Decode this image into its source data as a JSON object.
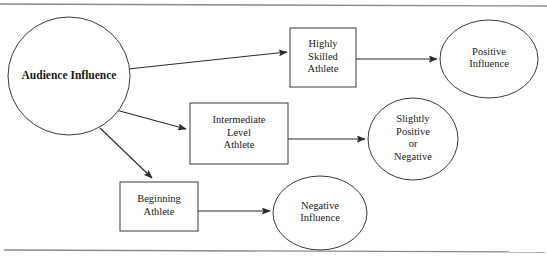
{
  "figure": {
    "type": "flow-diagram",
    "top_rule": true,
    "bottom_rule": true,
    "colors": {
      "background": "#ffffff",
      "shape_stroke": "#3a3a3a",
      "connector_stroke": "#2b2b2b",
      "rule_stroke": "#8a8a8a",
      "text": "#1a1a1a"
    }
  },
  "nodes": [
    {
      "id": "audience-influence",
      "shape": "circle",
      "bold": true,
      "lines": [
        "Audience Influence"
      ],
      "cx": 69,
      "cy": 76,
      "rx": 61,
      "ry": 59
    },
    {
      "id": "highly-skilled-athlete",
      "shape": "rect",
      "bold": false,
      "lines": [
        "Highly",
        "Skilled",
        "Athlete"
      ],
      "x": 290,
      "y": 28,
      "w": 66,
      "h": 59
    },
    {
      "id": "intermediate-level-athlete",
      "shape": "rect",
      "bold": false,
      "lines": [
        "Intermediate",
        "Level",
        "Athlete"
      ],
      "x": 190,
      "y": 103,
      "w": 98,
      "h": 61
    },
    {
      "id": "beginning-athlete",
      "shape": "rect",
      "bold": false,
      "lines": [
        "Beginning",
        "Athlete"
      ],
      "x": 120,
      "y": 182,
      "w": 78,
      "h": 49
    },
    {
      "id": "positive-influence",
      "shape": "ellipse",
      "bold": false,
      "lines": [
        "Positive",
        "Influence"
      ],
      "cx": 489,
      "cy": 59,
      "rx": 49,
      "ry": 39
    },
    {
      "id": "slightly-positive-or-negative",
      "shape": "ellipse",
      "bold": false,
      "lines": [
        "Slightly",
        "Positive",
        "or",
        "Negative"
      ],
      "cx": 413,
      "cy": 139,
      "rx": 45,
      "ry": 41
    },
    {
      "id": "negative-influence",
      "shape": "ellipse",
      "bold": false,
      "lines": [
        "Negative",
        "Influence"
      ],
      "cx": 320,
      "cy": 213,
      "rx": 47,
      "ry": 37
    }
  ],
  "connectors": [
    {
      "id": "audience-to-highly-skilled",
      "from": "audience-influence",
      "to": "highly-skilled-athlete",
      "x1": 128,
      "y1": 69,
      "x2": 287,
      "y2": 52
    },
    {
      "id": "audience-to-intermediate",
      "from": "audience-influence",
      "to": "intermediate-level-athlete",
      "x1": 116,
      "y1": 110,
      "x2": 186,
      "y2": 129
    },
    {
      "id": "audience-to-beginning",
      "from": "audience-influence",
      "to": "beginning-athlete",
      "x1": 100,
      "y1": 128,
      "x2": 152,
      "y2": 178
    },
    {
      "id": "highly-skilled-to-positive",
      "from": "highly-skilled-athlete",
      "to": "positive-influence",
      "x1": 356,
      "y1": 59,
      "x2": 437,
      "y2": 59
    },
    {
      "id": "intermediate-to-slightly",
      "from": "intermediate-level-athlete",
      "to": "slightly-positive-or-negative",
      "x1": 288,
      "y1": 139,
      "x2": 365,
      "y2": 139
    },
    {
      "id": "beginning-to-negative",
      "from": "beginning-athlete",
      "to": "negative-influence",
      "x1": 198,
      "y1": 211,
      "x2": 270,
      "y2": 211
    }
  ]
}
